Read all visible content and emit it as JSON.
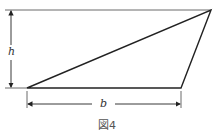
{
  "figure": {
    "caption": "図4",
    "labels": {
      "height": "h",
      "base": "b"
    },
    "triangle": {
      "vertices": [
        [
          27,
          88
        ],
        [
          181,
          88
        ],
        [
          211,
          10
        ]
      ],
      "stroke": "#222222"
    },
    "reference_line": {
      "x1": 5,
      "y1": 10,
      "x2": 211,
      "y2": 10
    },
    "height_dimension": {
      "x": 11,
      "y1": 10,
      "y2": 88
    },
    "base_dimension": {
      "y": 104,
      "x1": 27,
      "x2": 181
    }
  }
}
